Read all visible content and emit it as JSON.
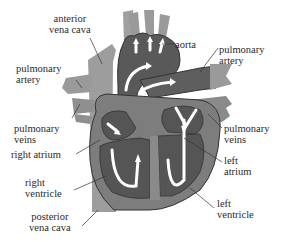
{
  "diagram": {
    "colors": {
      "vessel_light": "#9a9a9a",
      "chamber_dark": "#555555",
      "wall": "#7a7a7a",
      "outline": "#333333",
      "arrow": "#ffffff",
      "text": "#2a2a2a",
      "background": "#ffffff"
    },
    "labels": {
      "anterior_vena_cava": {
        "line1": "anterior",
        "line2": "vena cava"
      },
      "aorta": {
        "line1": "aorta"
      },
      "pulmonary_artery_left": {
        "line1": "pulmonary",
        "line2": "artery"
      },
      "pulmonary_artery_right": {
        "line1": "pulmonary",
        "line2": "artery"
      },
      "pulmonary_veins_left": {
        "line1": "pulmonary",
        "line2": "veins"
      },
      "pulmonary_veins_right": {
        "line1": "pulmonary",
        "line2": "veins"
      },
      "right_atrium": {
        "line1": "right atrium"
      },
      "left_atrium": {
        "line1": "left",
        "line2": "atrium"
      },
      "right_ventricle": {
        "line1": "right",
        "line2": "ventricle"
      },
      "left_ventricle": {
        "line1": "left",
        "line2": "ventricle"
      },
      "posterior_vena_cava": {
        "line1": "posterior",
        "line2": "vena cava"
      }
    }
  }
}
